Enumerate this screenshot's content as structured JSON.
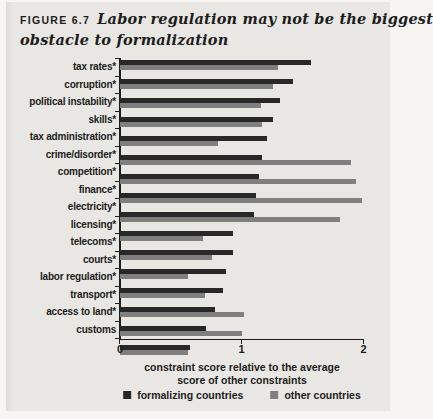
{
  "figure": {
    "label": "FIGURE 6.7",
    "title_line1": "Labor regulation may not be the biggest",
    "title_line2": "obstacle to formalization"
  },
  "chart_data": {
    "type": "bar",
    "orientation": "horizontal",
    "categories": [
      "tax rates*",
      "corruption*",
      "political instability*",
      "skills*",
      "tax administration*",
      "crime/disorder*",
      "competition*",
      "finance*",
      "electricity*",
      "licensing*",
      "telecoms*",
      "courts*",
      "labor regulation*",
      "transport*",
      "access to land*",
      "customs"
    ],
    "series": [
      {
        "name": "formalizing countries",
        "color": "#282828",
        "values": [
          1.57,
          1.42,
          1.32,
          1.26,
          1.21,
          1.17,
          1.14,
          1.12,
          1.1,
          0.93,
          0.93,
          0.87,
          0.85,
          0.78,
          0.71,
          0.58
        ]
      },
      {
        "name": "other countries",
        "color": "#7f7f7f",
        "values": [
          1.3,
          1.26,
          1.16,
          1.17,
          0.81,
          1.9,
          1.94,
          1.99,
          1.81,
          0.68,
          0.76,
          0.56,
          0.7,
          1.02,
          1.0,
          0.56
        ]
      }
    ],
    "xlabel": "constraint score relative to the average score of other constraints",
    "xlim": [
      0,
      2
    ],
    "xtick_labels": [
      "0",
      "1",
      "2"
    ],
    "grid": false,
    "legend_position": "bottom"
  },
  "colors": {
    "panel_background": "#e8e7e3",
    "text": "#1d1d1b",
    "axis": "#1d1d1b"
  }
}
